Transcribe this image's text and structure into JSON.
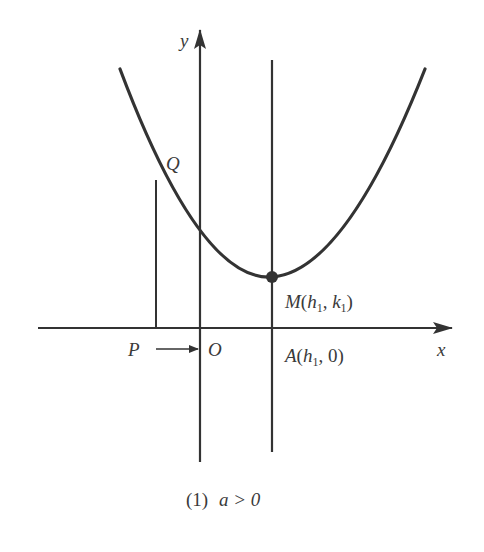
{
  "figure": {
    "caption_number": "(1)",
    "caption_condition": "a > 0",
    "colors": {
      "stroke": "#333333",
      "text": "#3a3a3a",
      "background": "#ffffff"
    }
  },
  "axes": {
    "x_label": "x",
    "y_label": "y",
    "origin_label": "O"
  },
  "points": {
    "Q": {
      "label": "Q"
    },
    "P": {
      "label": "P"
    },
    "M": {
      "name": "M",
      "h": "h",
      "k": "k",
      "sub": "1",
      "comma": ", "
    },
    "A": {
      "name": "A",
      "h": "h",
      "sub": "1",
      "zero": "0"
    }
  },
  "curve": {
    "type": "parabola",
    "opens": "up",
    "vertex_label": "M(h1, k1)"
  }
}
